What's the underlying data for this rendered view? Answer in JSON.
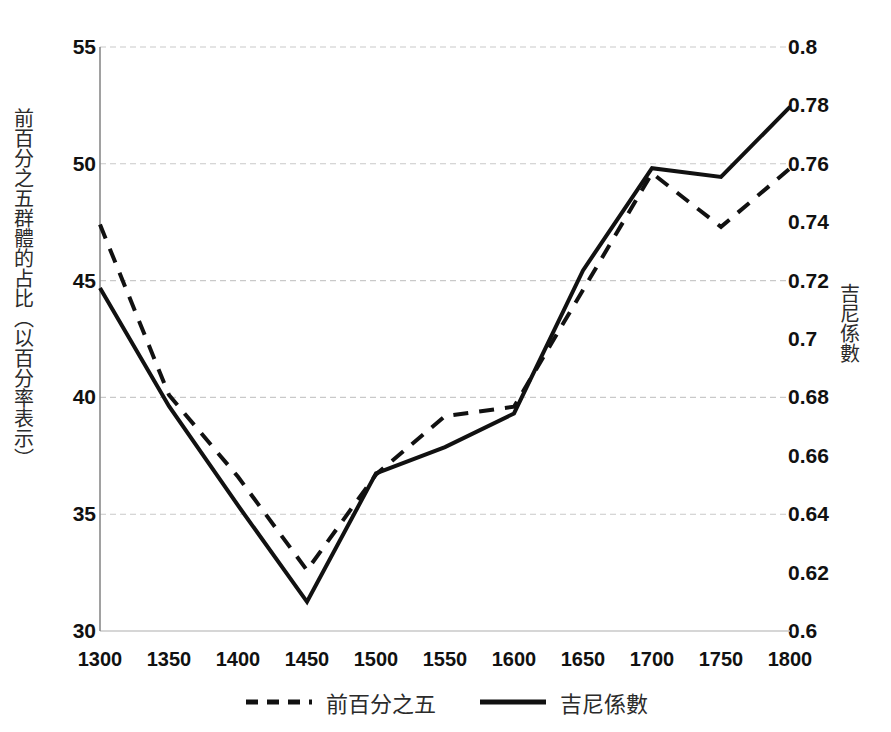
{
  "chart_data": {
    "type": "line",
    "title": "",
    "xlabel": "",
    "ylabel": "前百分之五群體的占比（以百分率表示）",
    "y2label": "吉尼係數",
    "grid": true,
    "legend_position": "bottom",
    "categories": [
      "1300",
      "1350",
      "1400",
      "1450",
      "1500",
      "1550",
      "1600",
      "1650",
      "1700",
      "1750",
      "1800"
    ],
    "x": [
      1300,
      1350,
      1400,
      1450,
      1500,
      1550,
      1600,
      1650,
      1700,
      1750,
      1800
    ],
    "xlim": [
      1300,
      1800
    ],
    "ylim": [
      30,
      55
    ],
    "y2lim": [
      0.6,
      0.8
    ],
    "yticks": [
      "30",
      "35",
      "40",
      "45",
      "50",
      "55"
    ],
    "ytick_values": [
      30,
      35,
      40,
      45,
      50,
      55
    ],
    "y2ticks": [
      "0.6",
      "0.62",
      "0.64",
      "0.66",
      "0.68",
      "0.7",
      "0.72",
      "0.74",
      "0.76",
      "0.78",
      "0.8"
    ],
    "y2tick_values": [
      0.6,
      0.62,
      0.64,
      0.66,
      0.68,
      0.7,
      0.72,
      0.74,
      0.76,
      0.78,
      0.8
    ],
    "series": [
      {
        "name": "前百分之五",
        "axis": "left",
        "style": "dashed",
        "color": "#111111",
        "values": [
          47.4,
          40.1,
          36.6,
          32.6,
          36.7,
          39.2,
          39.6,
          44.6,
          49.6,
          47.3,
          49.8
        ]
      },
      {
        "name": "吉尼係數",
        "axis": "right",
        "style": "solid",
        "color": "#111111",
        "values": [
          0.7175,
          0.677,
          0.643,
          0.61,
          0.654,
          0.663,
          0.6745,
          0.7235,
          0.7585,
          0.7555,
          0.7795
        ]
      }
    ]
  },
  "legend": {
    "items": [
      {
        "label": "前百分之五",
        "style": "dashed"
      },
      {
        "label": "吉尼係數",
        "style": "solid"
      }
    ]
  },
  "colors": {
    "line": "#111111",
    "grid": "#c9c9c9",
    "axis": "#8a8a8a",
    "text": "#1a1a1a"
  }
}
